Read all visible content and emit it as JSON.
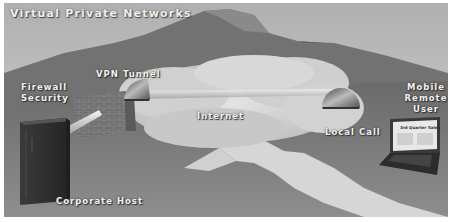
{
  "diagram": {
    "title": "Virtual Private Networks",
    "labels": {
      "vpn_tunnel": "VPN Tunnel",
      "firewall_line1": "Firewall",
      "firewall_line2": "Security",
      "internet": "Internet",
      "local_call": "Local Call",
      "mobile_line1": "Mobile",
      "mobile_line2": "Remote",
      "mobile_line3": "User",
      "corporate_host": "Corporate Host",
      "laptop_screen_title": "3rd Quarter Sales"
    },
    "colors": {
      "sky": "#c4c4c4",
      "mountain": "#6e6e6e",
      "ground": "#8a8a8a",
      "cloud": "#d8d8d8",
      "road": "#dcdcdc",
      "label_text": "#f2f2f2"
    },
    "elements": [
      "mountain",
      "cloud-internet",
      "vpn-tunnel-pipe",
      "firewall-brick-wall",
      "tunnel-portal-left",
      "tunnel-portal-right",
      "corporate-host-server",
      "laptop",
      "road"
    ]
  }
}
